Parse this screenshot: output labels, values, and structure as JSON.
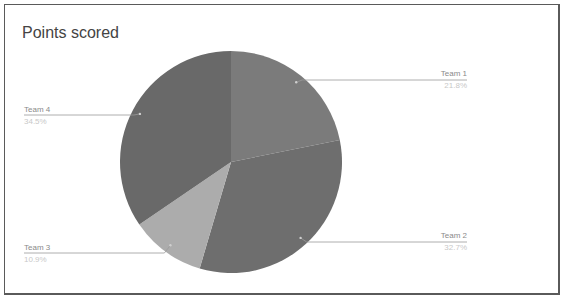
{
  "chart_data": {
    "type": "pie",
    "title": "Points scored",
    "categories": [
      "Team 1",
      "Team 2",
      "Team 3",
      "Team 4"
    ],
    "values": [
      21.8,
      32.7,
      10.9,
      34.5
    ],
    "unit": "%",
    "colors": [
      "#7b7b7b",
      "#6e6e6e",
      "#acacac",
      "#696969"
    ],
    "legend_position": "leader-labels",
    "labels": [
      {
        "name": "Team 1",
        "pct": "21.8%"
      },
      {
        "name": "Team 2",
        "pct": "32.7%"
      },
      {
        "name": "Team 3",
        "pct": "10.9%"
      },
      {
        "name": "Team 4",
        "pct": "34.5%"
      }
    ]
  }
}
